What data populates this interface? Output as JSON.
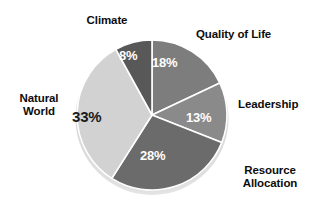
{
  "chart_data": {
    "type": "pie",
    "title": "",
    "subtitle": "",
    "xlabel": "",
    "ylabel": "",
    "legend_position": "none",
    "grid": false,
    "units": "percent",
    "total": 100,
    "start_angle_deg": 0,
    "direction": "clockwise",
    "background_color": "#ffffff",
    "separator_color": "#ffffff",
    "categories": [
      "Quality of Life",
      "Leadership",
      "Resource Allocation",
      "Natural World",
      "Climate"
    ],
    "values": [
      18,
      13,
      28,
      33,
      8
    ],
    "value_labels": [
      "18%",
      "13%",
      "28%",
      "33%",
      "8%"
    ],
    "colors": [
      "#7d7d7d",
      "#8a8a8a",
      "#6b6b6b",
      "#d2d2d2",
      "#585858"
    ],
    "slices": [
      {
        "label": "Quality of Life",
        "value": 18,
        "value_label": "18%",
        "color": "#7d7d7d",
        "label_text_color": "#0d0d0d",
        "value_text_color": "#ffffff"
      },
      {
        "label": "Leadership",
        "value": 13,
        "value_label": "13%",
        "color": "#8a8a8a",
        "label_text_color": "#0d0d0d",
        "value_text_color": "#ffffff"
      },
      {
        "label": "Resource\nAllocation",
        "value": 28,
        "value_label": "28%",
        "color": "#6b6b6b",
        "label_text_color": "#0d0d0d",
        "value_text_color": "#ffffff"
      },
      {
        "label": "Natural\nWorld",
        "value": 33,
        "value_label": "33%",
        "color": "#d2d2d2",
        "label_text_color": "#0d0d0d",
        "value_text_color": "#1a1a1a"
      },
      {
        "label": "Climate",
        "value": 8,
        "value_label": "8%",
        "color": "#585858",
        "label_text_color": "#0d0d0d",
        "value_text_color": "#ffffff"
      }
    ]
  },
  "labels": {
    "climate": "Climate",
    "quality_of_life": "Quality of Life",
    "leadership": "Leadership",
    "resource_allocation": "Resource\nAllocation",
    "natural_world": "Natural\nWorld"
  },
  "percentages": {
    "quality_of_life": "18%",
    "leadership": "13%",
    "resource_allocation": "28%",
    "natural_world": "33%",
    "climate": "8%"
  }
}
